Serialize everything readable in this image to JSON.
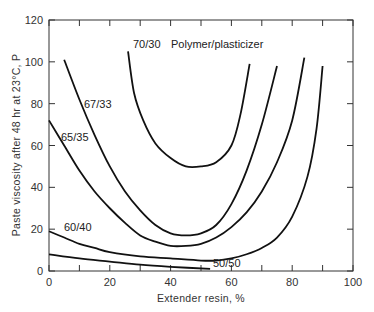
{
  "chart_data": {
    "type": "line",
    "title": "",
    "xlabel": "Extender resin, %",
    "ylabel": "Paste viscosity after 48 hr at 23°C, P",
    "xlim": [
      0,
      100
    ],
    "ylim": [
      0,
      120
    ],
    "x_ticks": [
      0,
      20,
      40,
      60,
      80,
      100
    ],
    "y_ticks": [
      0,
      20,
      40,
      60,
      80,
      100,
      120
    ],
    "grid": false,
    "legend": "inline labels",
    "annotation": "Polymer/plasticizer",
    "series": [
      {
        "name": "70/30",
        "points": [
          [
            26,
            105
          ],
          [
            28,
            85
          ],
          [
            31,
            72
          ],
          [
            35,
            61
          ],
          [
            40,
            54
          ],
          [
            45,
            50
          ],
          [
            50,
            50
          ],
          [
            55,
            52
          ],
          [
            60,
            60
          ],
          [
            63,
            75
          ],
          [
            66,
            99
          ]
        ]
      },
      {
        "name": "67/33",
        "points": [
          [
            5,
            101
          ],
          [
            10,
            82
          ],
          [
            15,
            65
          ],
          [
            20,
            50
          ],
          [
            25,
            38
          ],
          [
            30,
            29
          ],
          [
            35,
            22
          ],
          [
            40,
            18
          ],
          [
            45,
            17
          ],
          [
            50,
            18
          ],
          [
            55,
            22
          ],
          [
            60,
            32
          ],
          [
            65,
            48
          ],
          [
            70,
            70
          ],
          [
            75,
            98
          ]
        ]
      },
      {
        "name": "65/35",
        "points": [
          [
            0,
            72
          ],
          [
            5,
            60
          ],
          [
            10,
            48
          ],
          [
            15,
            38
          ],
          [
            20,
            30
          ],
          [
            25,
            23
          ],
          [
            30,
            17
          ],
          [
            35,
            14
          ],
          [
            40,
            12
          ],
          [
            45,
            12
          ],
          [
            50,
            13
          ],
          [
            55,
            16
          ],
          [
            60,
            21
          ],
          [
            65,
            28
          ],
          [
            70,
            38
          ],
          [
            75,
            52
          ],
          [
            80,
            72
          ],
          [
            84,
            102
          ]
        ]
      },
      {
        "name": "60/40",
        "points": [
          [
            0,
            19
          ],
          [
            5,
            16
          ],
          [
            10,
            13
          ],
          [
            15,
            11
          ],
          [
            20,
            9
          ],
          [
            30,
            7
          ],
          [
            40,
            6
          ],
          [
            50,
            5
          ],
          [
            55,
            5
          ],
          [
            60,
            6
          ],
          [
            65,
            8
          ],
          [
            70,
            11
          ],
          [
            75,
            16
          ],
          [
            80,
            26
          ],
          [
            85,
            45
          ],
          [
            88,
            68
          ],
          [
            90,
            98
          ]
        ]
      },
      {
        "name": "50/50",
        "points": [
          [
            0,
            8
          ],
          [
            10,
            6
          ],
          [
            20,
            4.5
          ],
          [
            30,
            3
          ],
          [
            40,
            2
          ],
          [
            53,
            1
          ]
        ]
      }
    ]
  },
  "labels": {
    "series_70_30": "70/30",
    "polymer_plasticizer": "Polymer/plasticizer",
    "series_67_33": "67/33",
    "series_65_35": "65/35",
    "series_60_40": "60/40",
    "series_50_50": "50/50"
  }
}
